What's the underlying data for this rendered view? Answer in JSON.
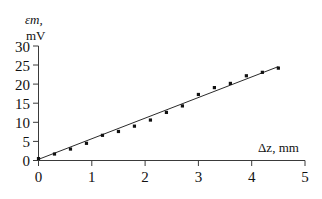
{
  "chart_data": {
    "type": "scatter",
    "title": "",
    "subtitle": "",
    "xlabel": "Δz, mm",
    "ylabel": "εm,",
    "ylabel_symbol": "ε",
    "ylabel_subscript": "m",
    "ylabel_units": "mV",
    "xlim": [
      0,
      5
    ],
    "ylim": [
      0,
      30
    ],
    "xticks": [
      "0",
      "1",
      "2",
      "3",
      "4",
      "5"
    ],
    "xtick_values": [
      0,
      1,
      2,
      3,
      4,
      5
    ],
    "yticks": [
      "0",
      "5",
      "10",
      "15",
      "20",
      "25",
      "30"
    ],
    "ytick_values": [
      0,
      5,
      10,
      15,
      20,
      25,
      30
    ],
    "grid": false,
    "legend": null,
    "marker": "filled-square",
    "marker_color": "#111111",
    "line_color": "#2b2b2b",
    "axis_color": "#3a3a3a",
    "series": [
      {
        "name": "measured EMF",
        "x": [
          0.0,
          0.3,
          0.6,
          0.9,
          1.2,
          1.5,
          1.8,
          2.1,
          2.4,
          2.7,
          3.0,
          3.3,
          3.6,
          3.9,
          4.2,
          4.5
        ],
        "y": [
          0.5,
          1.7,
          3.0,
          4.5,
          6.6,
          7.6,
          9.0,
          10.6,
          12.6,
          14.3,
          17.3,
          19.1,
          20.2,
          22.2,
          23.1,
          24.2
        ]
      },
      {
        "name": "linear fit",
        "type": "line",
        "x": [
          0.0,
          4.5
        ],
        "y": [
          0.3,
          24.6
        ],
        "slope": 5.4,
        "intercept": 0.3
      }
    ]
  }
}
